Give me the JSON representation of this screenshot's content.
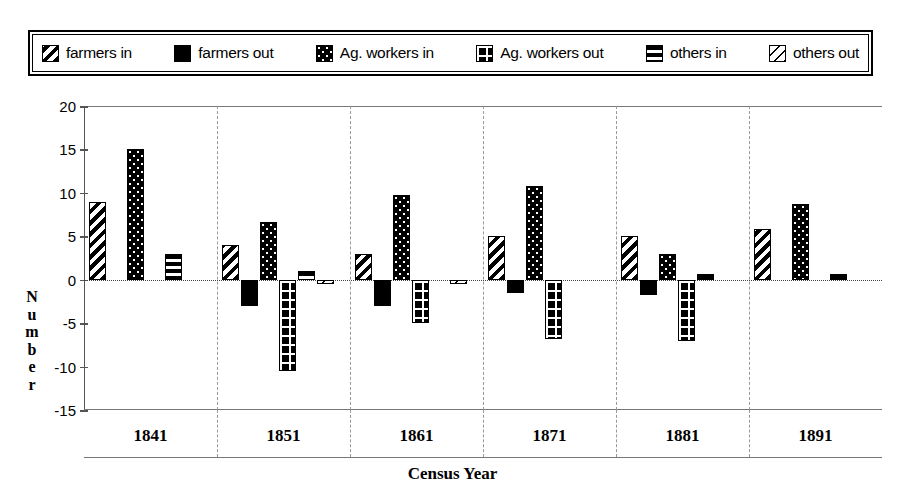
{
  "legend": {
    "items": [
      {
        "label": "farmers in",
        "icon": "diagonal-stripe-swatch",
        "pattern": "pat-farmers-in"
      },
      {
        "label": "farmers out",
        "icon": "solid-black-swatch",
        "pattern": "pat-farmers-out"
      },
      {
        "label": "Ag. workers in",
        "icon": "black-dotted-swatch",
        "pattern": "pat-ag-in"
      },
      {
        "label": "Ag. workers out",
        "icon": "black-grid-swatch",
        "pattern": "pat-ag-out"
      },
      {
        "label": "others in",
        "icon": "horizontal-stripe-swatch",
        "pattern": "pat-others-in"
      },
      {
        "label": "others out",
        "icon": "light-diagonal-swatch",
        "pattern": "pat-others-out"
      }
    ]
  },
  "axis": {
    "y_title_letters": [
      "N",
      "u",
      "m",
      "b",
      "e",
      "r"
    ],
    "y_ticks": [
      20,
      15,
      10,
      5,
      0,
      -5,
      -10,
      -15
    ],
    "x_title": "Census Year"
  },
  "chart_data": {
    "type": "bar",
    "title": "",
    "xlabel": "Census Year",
    "ylabel": "Number",
    "ylim": [
      -15,
      20
    ],
    "ytick_step": 5,
    "grid": false,
    "legend_position": "top",
    "categories": [
      "1841",
      "1851",
      "1861",
      "1871",
      "1881",
      "1891"
    ],
    "series": [
      {
        "name": "farmers in",
        "values": [
          9,
          4,
          3,
          5,
          5,
          5.8
        ]
      },
      {
        "name": "farmers out",
        "values": [
          0,
          -3,
          -3,
          -1.5,
          -1.8,
          0
        ]
      },
      {
        "name": "Ag. workers in",
        "values": [
          15,
          6.7,
          9.8,
          10.8,
          3,
          8.7
        ]
      },
      {
        "name": "Ag. workers out",
        "values": [
          0,
          -10.5,
          -5,
          -6.8,
          -7,
          0
        ]
      },
      {
        "name": "others in",
        "values": [
          3,
          1,
          0,
          0,
          0.7,
          0.7
        ]
      },
      {
        "name": "others out",
        "values": [
          0,
          -0.5,
          -0.5,
          0,
          0,
          0
        ]
      }
    ]
  }
}
